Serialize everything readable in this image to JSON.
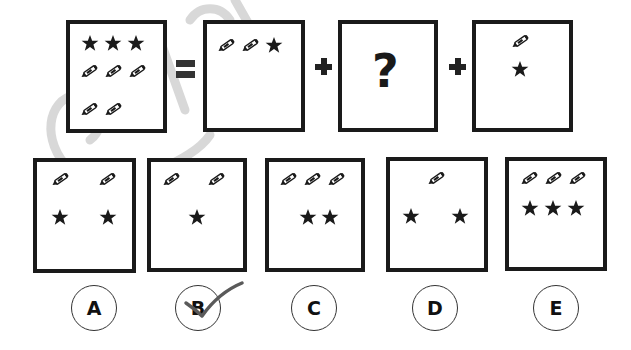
{
  "puzzle": {
    "equation": {
      "lhs": {
        "stars": 3,
        "pencils": 5
      },
      "equals_symbol": "=",
      "term1": {
        "pencils": 2,
        "stars": 1
      },
      "plus_symbol_1": "+",
      "unknown": "?",
      "plus_symbol_2": "+",
      "term3": {
        "pencils": 1,
        "stars": 1
      }
    },
    "options": [
      {
        "label": "A",
        "pencils": 2,
        "stars": 2
      },
      {
        "label": "B",
        "pencils": 2,
        "stars": 1
      },
      {
        "label": "C",
        "pencils": 3,
        "stars": 2
      },
      {
        "label": "D",
        "pencils": 1,
        "stars": 2
      },
      {
        "label": "E",
        "pencils": 3,
        "stars": 3
      }
    ],
    "marked_answer": "B"
  },
  "icons": {
    "star": "star-icon",
    "pencil": "pencil-icon",
    "check": "checkmark-icon"
  },
  "colors": {
    "ink": "#1a1a1a",
    "watermark": "#d6d6d6",
    "check": "#555555"
  }
}
